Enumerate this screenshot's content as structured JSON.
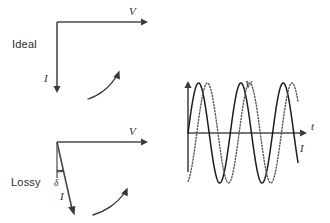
{
  "figure": {
    "background_color": "#ffffff",
    "ink_color": "#333333"
  },
  "panels": {
    "ideal": {
      "label": "Ideal",
      "voltage_label": "V",
      "current_label": "I",
      "phase_angle_deg": 90,
      "description": "Current leads voltage by 90 degrees"
    },
    "lossy": {
      "label": "Lossy",
      "voltage_label": "V",
      "current_label": "I",
      "loss_angle_label": "δ",
      "phase_angle_deg": 80,
      "description": "Current leads voltage by less than 90 degrees; loss angle delta"
    },
    "waveform": {
      "time_axis_label": "t",
      "voltage_curve_label": "V",
      "current_curve_label": "I"
    }
  },
  "chart_data": {
    "type": "line",
    "title": "",
    "xlabel": "t",
    "ylabel": "",
    "grid": false,
    "legend": "inline-curve-labels",
    "xlim": [
      0,
      2.6
    ],
    "ylim": [
      -1.15,
      1.15
    ],
    "x_units": "periods",
    "series": [
      {
        "name": "V",
        "label": "V",
        "style": "solid",
        "color": "#1c1c1c",
        "amplitude": 1.0,
        "periods": 2.6,
        "phase_deg": 0,
        "description": "Solid sinusoid, voltage"
      },
      {
        "name": "I",
        "label": "I",
        "style": "dotted",
        "color": "#555555",
        "amplitude": 1.0,
        "periods": 2.6,
        "phase_deg": -75,
        "description": "Dotted sinusoid, current, lagging the solid voltage trace"
      }
    ]
  }
}
